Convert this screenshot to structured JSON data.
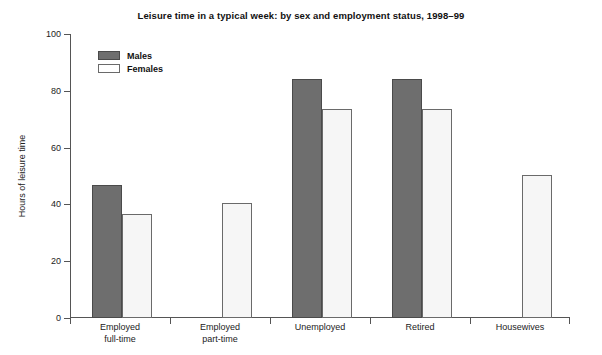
{
  "chart_data": {
    "type": "bar",
    "title": "Leisure time in a typical week: by sex and employment status, 1998–99",
    "xlabel": "",
    "ylabel": "Hours of leisure time",
    "ylim": [
      0,
      100
    ],
    "yticks": [
      0,
      20,
      40,
      60,
      80,
      100
    ],
    "grid": false,
    "legend_position": "top-left",
    "categories": [
      "Employed full-time",
      "Employed part-time",
      "Unemployed",
      "Retired",
      "Housewives"
    ],
    "category_lines": [
      [
        "Employed",
        "full-time"
      ],
      [
        "Employed",
        "part-time"
      ],
      [
        "Unemployed",
        ""
      ],
      [
        "Retired",
        ""
      ],
      [
        "Housewives",
        ""
      ]
    ],
    "series": [
      {
        "name": "Males",
        "color": "#6e6e6e",
        "values": [
          47,
          null,
          84,
          84,
          null
        ]
      },
      {
        "name": "Females",
        "color": "#f6f6f6",
        "values": [
          36.5,
          40.5,
          73.5,
          73.5,
          50.5
        ]
      }
    ]
  },
  "axis": {
    "tick_labels": [
      "100",
      "80",
      "60",
      "40",
      "20",
      "0"
    ],
    "y_axis_title": "Hours of leisure time"
  },
  "legend": {
    "items": [
      {
        "label": "Males"
      },
      {
        "label": "Females"
      }
    ]
  }
}
